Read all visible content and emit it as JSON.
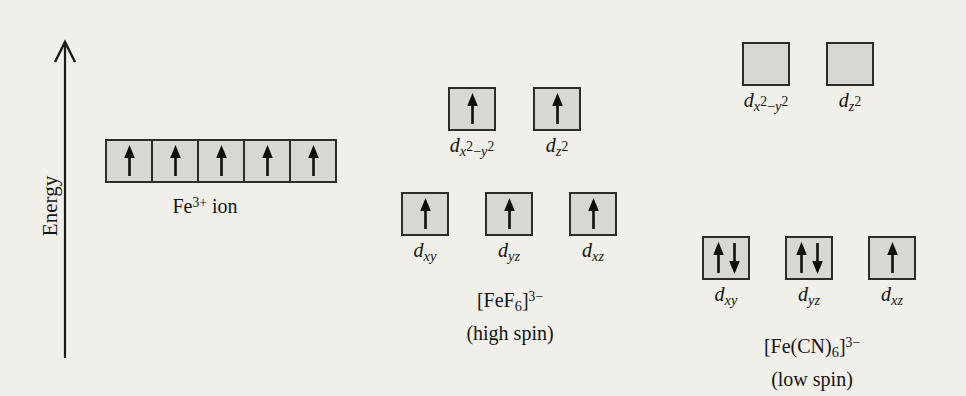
{
  "colors": {
    "background": "#f0efe9",
    "box_fill": "#d8d7d2",
    "box_border": "#2d2c29",
    "arrow": "#0f0e0d",
    "axis": "#1d1c1a",
    "text": "#151413"
  },
  "energy_axis": {
    "label": "Energy"
  },
  "groups": [
    {
      "name": "Fe3+ ion",
      "caption_lines": [
        [
          [
            "t",
            "Fe"
          ],
          [
            "sp",
            "3+"
          ],
          [
            "t",
            " ion"
          ]
        ]
      ],
      "levels": [
        {
          "name": "d-orbitals-degenerate",
          "boxes": [
            {
              "electrons": "up"
            },
            {
              "electrons": "up"
            },
            {
              "electrons": "up"
            },
            {
              "electrons": "up"
            },
            {
              "electrons": "up"
            }
          ]
        }
      ]
    },
    {
      "name": "[FeF6]3- (high spin)",
      "caption_lines": [
        [
          [
            "t",
            "[FeF"
          ],
          [
            "sb",
            "6"
          ],
          [
            "t",
            "]"
          ],
          [
            "sp",
            "3−"
          ]
        ],
        [
          [
            "t",
            "(high spin)"
          ]
        ]
      ],
      "levels": [
        {
          "name": "eg",
          "boxes": [
            {
              "electrons": "up",
              "label": [
                [
                  "it",
                  "d"
                ],
                [
                  "sbi",
                  "x"
                ],
                [
                  "s2",
                  "2"
                ],
                [
                  "sb",
                  "−"
                ],
                [
                  "sbi",
                  "y"
                ],
                [
                  "s2",
                  "2"
                ]
              ]
            },
            {
              "electrons": "up",
              "label": [
                [
                  "it",
                  "d"
                ],
                [
                  "sbi",
                  "z"
                ],
                [
                  "s2",
                  "2"
                ]
              ]
            }
          ]
        },
        {
          "name": "t2g",
          "boxes": [
            {
              "electrons": "up",
              "label": [
                [
                  "it",
                  "d"
                ],
                [
                  "sbi",
                  "xy"
                ]
              ]
            },
            {
              "electrons": "up",
              "label": [
                [
                  "it",
                  "d"
                ],
                [
                  "sbi",
                  "yz"
                ]
              ]
            },
            {
              "electrons": "up",
              "label": [
                [
                  "it",
                  "d"
                ],
                [
                  "sbi",
                  "xz"
                ]
              ]
            }
          ]
        }
      ]
    },
    {
      "name": "[Fe(CN)6]3- (low spin)",
      "caption_lines": [
        [
          [
            "t",
            "[Fe(CN)"
          ],
          [
            "sb",
            "6"
          ],
          [
            "t",
            "]"
          ],
          [
            "sp",
            "3−"
          ]
        ],
        [
          [
            "t",
            "(low spin)"
          ]
        ]
      ],
      "levels": [
        {
          "name": "eg",
          "boxes": [
            {
              "electrons": "none",
              "label": [
                [
                  "it",
                  "d"
                ],
                [
                  "sbi",
                  "x"
                ],
                [
                  "s2",
                  "2"
                ],
                [
                  "sb",
                  "−"
                ],
                [
                  "sbi",
                  "y"
                ],
                [
                  "s2",
                  "2"
                ]
              ]
            },
            {
              "electrons": "none",
              "label": [
                [
                  "it",
                  "d"
                ],
                [
                  "sbi",
                  "z"
                ],
                [
                  "s2",
                  "2"
                ]
              ]
            }
          ]
        },
        {
          "name": "t2g",
          "boxes": [
            {
              "electrons": "up-down",
              "label": [
                [
                  "it",
                  "d"
                ],
                [
                  "sbi",
                  "xy"
                ]
              ]
            },
            {
              "electrons": "up-down",
              "label": [
                [
                  "it",
                  "d"
                ],
                [
                  "sbi",
                  "yz"
                ]
              ]
            },
            {
              "electrons": "up",
              "label": [
                [
                  "it",
                  "d"
                ],
                [
                  "sbi",
                  "xz"
                ]
              ]
            }
          ]
        }
      ]
    }
  ]
}
